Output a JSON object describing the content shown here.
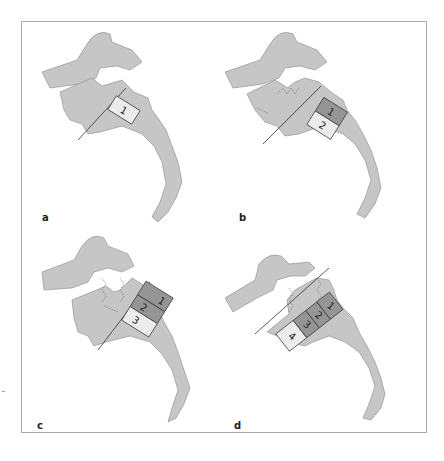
{
  "figure": {
    "panels": [
      {
        "id": "a",
        "label": "a",
        "blocks": [
          {
            "text": "1",
            "shade": "light"
          }
        ]
      },
      {
        "id": "b",
        "label": "b",
        "blocks": [
          {
            "text": "1",
            "shade": "dark"
          },
          {
            "text": "2",
            "shade": "light"
          }
        ]
      },
      {
        "id": "c",
        "label": "c",
        "blocks": [
          {
            "text": "1",
            "shade": "dark"
          },
          {
            "text": "2",
            "shade": "dark"
          },
          {
            "text": "3",
            "shade": "light"
          }
        ]
      },
      {
        "id": "d",
        "label": "d",
        "blocks": [
          {
            "text": "1",
            "shade": "dark"
          },
          {
            "text": "2",
            "shade": "dark"
          },
          {
            "text": "3",
            "shade": "dark"
          },
          {
            "text": "4",
            "shade": "light"
          }
        ]
      }
    ]
  },
  "colors": {
    "bone_fill": "#c6c6c6",
    "bone_outline": "#8a8a8a",
    "block_light": "#ececec",
    "block_dark": "#959595",
    "frame": "#a8a8a8"
  }
}
